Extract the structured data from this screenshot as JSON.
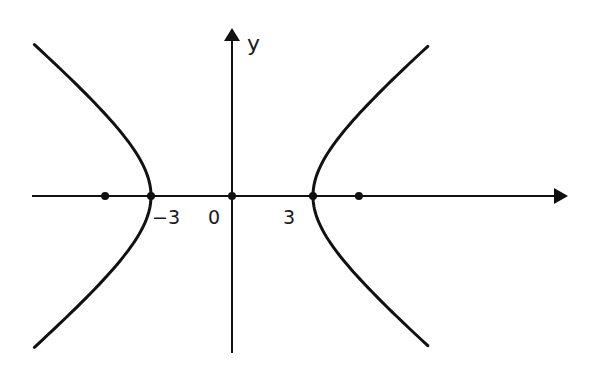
{
  "diagram": {
    "type": "hyperbola-graph",
    "colors": {
      "background": "#ffffff",
      "stroke": "#111111",
      "text": "#1a1a1a"
    },
    "axes": {
      "x_axis": {
        "label": "",
        "arrow": "right"
      },
      "y_axis": {
        "label": "y",
        "arrow": "up"
      }
    },
    "tick_labels": [
      {
        "text": "−3",
        "value": -3
      },
      {
        "text": "0",
        "value": 0
      },
      {
        "text": "3",
        "value": 3
      }
    ],
    "points_on_x_axis": [
      {
        "name": "left-focus",
        "value": -4.7
      },
      {
        "name": "left-vertex",
        "value": -3
      },
      {
        "name": "origin",
        "value": 0
      },
      {
        "name": "right-vertex",
        "value": 3
      },
      {
        "name": "right-focus",
        "value": 4.7
      }
    ],
    "curve": {
      "kind": "hyperbola",
      "orientation": "horizontal",
      "vertices": [
        -3,
        3
      ]
    }
  },
  "layout": {
    "origin_px": [
      232,
      196
    ],
    "unit_px": 27,
    "a_px": 81,
    "b_px": 68,
    "t_max_left": 1.54,
    "t_max_right": 1.53,
    "x_axis_px": {
      "x1": 32,
      "x2": 568
    },
    "y_axis_px": {
      "y1": 28,
      "y2": 353
    }
  }
}
